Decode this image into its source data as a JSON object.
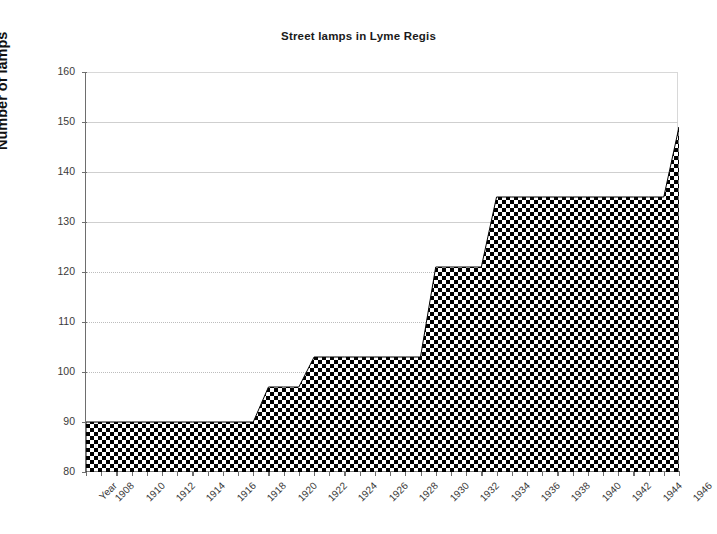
{
  "chart_data": {
    "type": "area",
    "title": "Street lamps in Lyme Regis",
    "xlabel": "",
    "ylabel": "Number of lamps",
    "ylim": [
      80,
      160
    ],
    "yticks": [
      80,
      90,
      100,
      110,
      120,
      130,
      140,
      150,
      160
    ],
    "grid": true,
    "legend": "none",
    "fill_pattern": "black-and-white checkerboard",
    "x_first_label": "Year",
    "xtick_labels": [
      "Year",
      "1908",
      "1910",
      "1912",
      "1914",
      "1916",
      "1918",
      "1920",
      "1922",
      "1924",
      "1926",
      "1928",
      "1930",
      "1932",
      "1934",
      "1936",
      "1938",
      "1940",
      "1942",
      "1944",
      "1946"
    ],
    "xlim": [
      1907,
      1946
    ],
    "x": [
      1907,
      1908,
      1909,
      1910,
      1911,
      1912,
      1913,
      1914,
      1915,
      1916,
      1917,
      1918,
      1919,
      1920,
      1921,
      1922,
      1923,
      1924,
      1925,
      1926,
      1927,
      1928,
      1929,
      1930,
      1931,
      1932,
      1933,
      1934,
      1935,
      1936,
      1937,
      1938,
      1939,
      1940,
      1941,
      1942,
      1943,
      1944,
      1945,
      1946
    ],
    "values": [
      90,
      90,
      90,
      90,
      90,
      90,
      90,
      90,
      90,
      90,
      90,
      90,
      97,
      97,
      97,
      103,
      103,
      103,
      103,
      103,
      103,
      103,
      103,
      121,
      121,
      121,
      121,
      135,
      135,
      135,
      135,
      135,
      135,
      135,
      135,
      135,
      135,
      135,
      135,
      149
    ]
  },
  "colors": {
    "axis": "#6e6e6e",
    "grid": "#cfcfcf",
    "series_dark": "#000000",
    "series_light": "#ffffff",
    "text": "#3a3a3a",
    "title": "#1a1a1a"
  }
}
